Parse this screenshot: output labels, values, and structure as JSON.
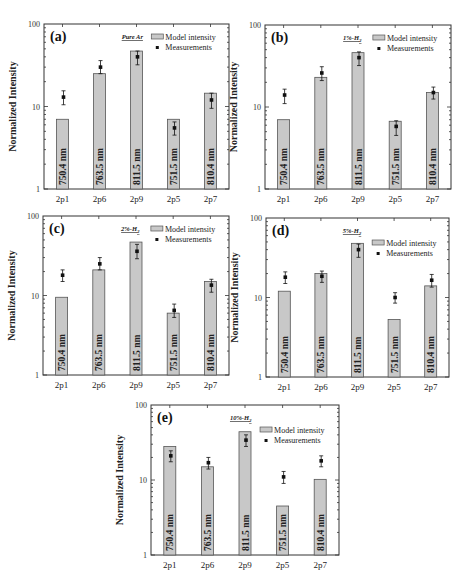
{
  "figure": {
    "ylabel": "Normalized Intensity",
    "categories": [
      "2p1",
      "2p6",
      "2p9",
      "2p5",
      "2p7"
    ],
    "wavelength_labels": [
      "750.4 nm",
      "763.5 nm",
      "811.5 nm",
      "751.5 nm",
      "810.4 nm"
    ],
    "legend": {
      "bar": "Model intensity",
      "point": "Measurements"
    },
    "yticks": [
      "1",
      "10",
      "100"
    ],
    "colors": {
      "bar_fill": "#c8c8c8",
      "bar_stroke": "#555555",
      "axis": "#333333",
      "point": "#111111"
    }
  },
  "chart_data": [
    {
      "type": "bar",
      "panel": "(a)",
      "title": "Pure Ar",
      "categories": [
        "2p1",
        "2p6",
        "2p9",
        "2p5",
        "2p7"
      ],
      "bar_labels": [
        "750.4 nm",
        "763.5 nm",
        "811.5 nm",
        "751.5 nm",
        "810.4 nm"
      ],
      "series": [
        {
          "name": "Model intensity",
          "values": [
            7,
            25,
            47,
            7,
            14.5
          ]
        },
        {
          "name": "Measurements",
          "values": [
            13,
            30,
            40,
            5.5,
            12
          ],
          "err_low": [
            10.5,
            25,
            32,
            4.5,
            9.5
          ],
          "err_high": [
            15.5,
            36,
            47,
            6.5,
            14.5
          ]
        }
      ],
      "xlabel": "",
      "ylabel": "Normalized Intensity",
      "yscale": "log",
      "ylim": [
        1,
        100
      ]
    },
    {
      "type": "bar",
      "panel": "(b)",
      "title": "1%-H2",
      "categories": [
        "2p1",
        "2p6",
        "2p9",
        "2p5",
        "2p7"
      ],
      "bar_labels": [
        "750.4 nm",
        "763.5 nm",
        "811.5 nm",
        "751.5 nm",
        "810.4 nm"
      ],
      "series": [
        {
          "name": "Model intensity",
          "values": [
            7,
            23,
            46,
            6.7,
            15
          ]
        },
        {
          "name": "Measurements",
          "values": [
            14,
            26,
            40,
            5.8,
            15
          ],
          "err_low": [
            11,
            21,
            32,
            4.5,
            12.5
          ],
          "err_high": [
            16.5,
            31,
            47,
            6.8,
            17.5
          ]
        }
      ],
      "xlabel": "",
      "ylabel": "Normalized Intensity",
      "yscale": "log",
      "ylim": [
        1,
        100
      ]
    },
    {
      "type": "bar",
      "panel": "(c)",
      "title": "2%-H2",
      "categories": [
        "2p1",
        "2p6",
        "2p9",
        "2p5",
        "2p7"
      ],
      "bar_labels": [
        "750.4 nm",
        "763.5 nm",
        "811.5 nm",
        "751.5 nm",
        "810.4 nm"
      ],
      "series": [
        {
          "name": "Model intensity",
          "values": [
            9.5,
            21,
            47,
            6,
            15
          ]
        },
        {
          "name": "Measurements",
          "values": [
            18,
            25,
            36,
            6.5,
            13.5
          ],
          "err_low": [
            15,
            21,
            29,
            5.3,
            11
          ],
          "err_high": [
            21,
            30,
            44,
            7.8,
            16
          ]
        }
      ],
      "xlabel": "",
      "ylabel": "Normalized Intensity",
      "yscale": "log",
      "ylim": [
        1,
        100
      ]
    },
    {
      "type": "bar",
      "panel": "(d)",
      "title": "5%-H2",
      "categories": [
        "2p1",
        "2p6",
        "2p9",
        "2p5",
        "2p7"
      ],
      "bar_labels": [
        "750.4 nm",
        "763.5 nm",
        "811.5 nm",
        "751.5 nm",
        "810.4 nm"
      ],
      "series": [
        {
          "name": "Model intensity",
          "values": [
            12,
            20,
            48,
            5.3,
            14
          ]
        },
        {
          "name": "Measurements",
          "values": [
            18,
            18.5,
            40,
            10,
            16.5
          ],
          "err_low": [
            15,
            15.5,
            32,
            8.5,
            13.5
          ],
          "err_high": [
            21,
            21.5,
            47,
            11.5,
            19.5
          ]
        }
      ],
      "xlabel": "",
      "ylabel": "Normalized Intensity",
      "yscale": "log",
      "ylim": [
        1,
        100
      ]
    },
    {
      "type": "bar",
      "panel": "(e)",
      "title": "10%-H2",
      "categories": [
        "2p1",
        "2p6",
        "2p9",
        "2p5",
        "2p7"
      ],
      "bar_labels": [
        "750.4 nm",
        "763.5 nm",
        "811.5 nm",
        "751.5 nm",
        "810.4 nm"
      ],
      "series": [
        {
          "name": "Model intensity",
          "values": [
            28,
            15,
            44,
            4.5,
            10.2
          ]
        },
        {
          "name": "Measurements",
          "values": [
            21,
            17,
            34,
            11,
            18
          ],
          "err_low": [
            17.5,
            14,
            28,
            9,
            15
          ],
          "err_high": [
            24.5,
            20,
            40,
            13,
            21
          ]
        }
      ],
      "xlabel": "",
      "ylabel": "Normalized Intensity",
      "yscale": "log",
      "ylim": [
        1,
        100
      ]
    }
  ],
  "layout": {
    "panels": [
      {
        "id": "a",
        "left": 44,
        "top": 24,
        "width": 185,
        "height": 165
      },
      {
        "id": "b",
        "left": 265,
        "top": 25,
        "width": 186,
        "height": 164
      },
      {
        "id": "c",
        "left": 43,
        "top": 216,
        "width": 186,
        "height": 159
      },
      {
        "id": "d",
        "left": 266,
        "top": 218,
        "width": 183,
        "height": 159
      },
      {
        "id": "e",
        "left": 151,
        "top": 405,
        "width": 188,
        "height": 150
      }
    ]
  }
}
